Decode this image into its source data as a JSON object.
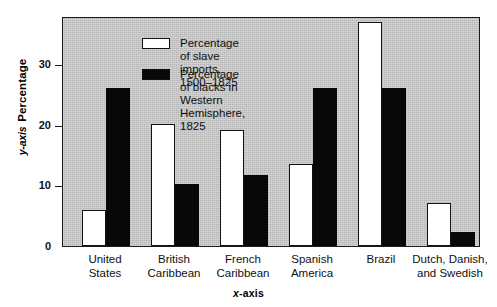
{
  "chart_data": {
    "type": "bar",
    "title": "",
    "subtitle": "",
    "xlabel": "x-axis",
    "ylabel": "Percentage",
    "y_axis_name": "y-axis",
    "ylim": [
      0,
      38
    ],
    "yticks": [
      0,
      10,
      20,
      30
    ],
    "ytick_labels": [
      "0",
      "10",
      "20",
      "30"
    ],
    "grid": false,
    "legend_position": "top-left-inside",
    "categories": [
      "United States",
      "British Caribbean",
      "French Caribbean",
      "Spanish America",
      "Brazil",
      "Dutch, Danish, and Swedish"
    ],
    "category_lines": [
      [
        "United",
        "States"
      ],
      [
        "British",
        "Caribbean"
      ],
      [
        "French",
        "Caribbean"
      ],
      [
        "Spanish",
        "America"
      ],
      [
        "Brazil",
        ""
      ],
      [
        "Dutch, Danish,",
        "and Swedish"
      ]
    ],
    "series": [
      {
        "name": "Percentage of slave imports, 1500–1825",
        "key": "imports",
        "color": "#ffffff",
        "edge_color": "#121212",
        "values": [
          6,
          20.1,
          19.1,
          13.6,
          37,
          7.1
        ]
      },
      {
        "name": "Percentage of blacks in\nWestern Hemisphere, 1825",
        "key": "blacks",
        "color": "#080808",
        "edge_color": "#080808",
        "values": [
          26.1,
          10.2,
          11.7,
          26.1,
          26.1,
          2.3
        ]
      }
    ]
  },
  "legend": [
    {
      "swatch": "imports",
      "label": "Percentage of slave imports, 1500–1825"
    },
    {
      "swatch": "blacks",
      "label": "Percentage of blacks in\nWestern Hemisphere, 1825"
    }
  ],
  "colors": {
    "plot_background": "#c9c9c9",
    "page_background": "#ffffff",
    "axis": "#1a1a1a",
    "bar_imports": "#ffffff",
    "bar_blacks": "#080808"
  }
}
